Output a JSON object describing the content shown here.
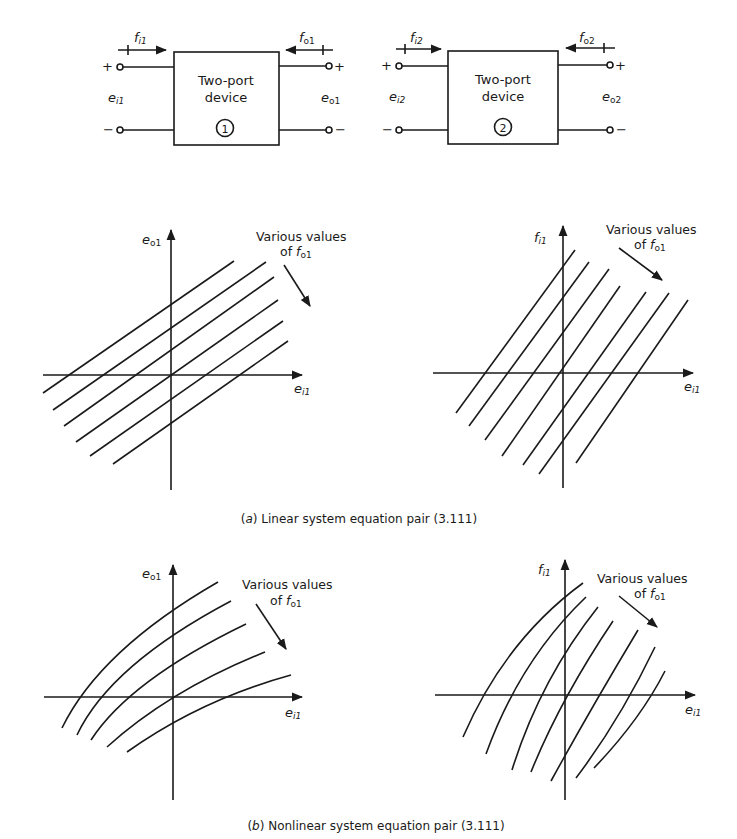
{
  "devices": [
    {
      "id": 1,
      "box_label_line1": "Two-port",
      "box_label_line2": "device",
      "number": "1",
      "input_flow": "f",
      "input_flow_sub": "i1",
      "output_flow": "f",
      "output_flow_sub": "o1",
      "input_effort": "e",
      "input_effort_sub": "i1",
      "output_effort": "e",
      "output_effort_sub": "o1",
      "plus": "+",
      "minus": "−"
    },
    {
      "id": 2,
      "box_label_line1": "Two-port",
      "box_label_line2": "device",
      "number": "2",
      "input_flow": "f",
      "input_flow_sub": "i2",
      "output_flow": "f",
      "output_flow_sub": "o2",
      "input_effort": "e",
      "input_effort_sub": "i2",
      "output_effort": "e",
      "output_effort_sub": "o2",
      "plus": "+",
      "minus": "−"
    }
  ],
  "panels": {
    "a_left": {
      "y_axis": "e",
      "y_axis_sub": "o1",
      "x_axis": "e",
      "x_axis_sub": "i1",
      "annotation_line1": "Various values",
      "annotation_line2_prefix": "of ",
      "annotation_var": "f",
      "annotation_sub": "o1"
    },
    "a_right": {
      "y_axis": "f",
      "y_axis_sub": "i1",
      "x_axis": "e",
      "x_axis_sub": "i1",
      "annotation_line1": "Various values",
      "annotation_line2_prefix": "of ",
      "annotation_var": "f",
      "annotation_sub": "o1"
    },
    "b_left": {
      "y_axis": "e",
      "y_axis_sub": "o1",
      "x_axis": "e",
      "x_axis_sub": "i1",
      "annotation_line1": "Various values",
      "annotation_line2_prefix": "of ",
      "annotation_var": "f",
      "annotation_sub": "o1"
    },
    "b_right": {
      "y_axis": "f",
      "y_axis_sub": "i1",
      "x_axis": "e",
      "x_axis_sub": "i1",
      "annotation_line1": "Various values",
      "annotation_line2_prefix": "of ",
      "annotation_var": "f",
      "annotation_sub": "o1"
    }
  },
  "captions": {
    "a_letter": "a",
    "a_text": "Linear system equation pair (3.111)",
    "b_letter": "b",
    "b_text": "Nonlinear system equation pair (3.111)"
  },
  "colors": {
    "ink": "#1a1a1a",
    "background": "#ffffff"
  }
}
